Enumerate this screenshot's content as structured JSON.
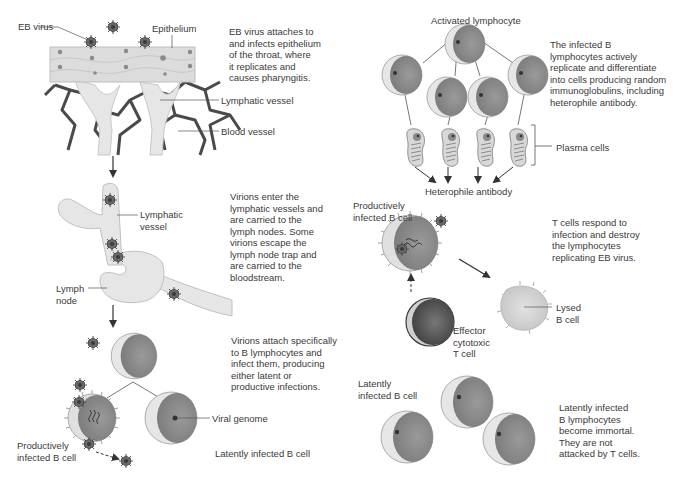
{
  "colors": {
    "background": "#ffffff",
    "text": "#3a3a3a",
    "epithelium": "#d8d8d8",
    "blood_vessel": "#4a4a4a",
    "lymphatic": "#e6e6e6",
    "cell_light": "#e8e8e8",
    "cell_dark": "#8f8f8f",
    "t_cell": "#555555",
    "virus": "#555555"
  },
  "left_panel": {
    "step1": {
      "labels": {
        "eb_virus": "EB virus",
        "epithelium": "Epithelium",
        "lymphatic_vessel": "Lymphatic vessel",
        "blood_vessel": "Blood vessel"
      },
      "description": "EB virus attaches to\nand infects epithelium\nof the throat, where\nit replicates and\ncauses pharyngitis."
    },
    "step2": {
      "labels": {
        "lymphatic_vessel": "Lymphatic\nvessel",
        "lymph_node": "Lymph\nnode"
      },
      "description": "Virions enter the\nlymphatic vessels and\nare carried to the\nlymph nodes. Some\nvirions escape the\nlymph node trap and\nare carried to the\nbloodstream."
    },
    "step3": {
      "labels": {
        "viral_genome": "Viral genome",
        "productively_infected": "Productively\ninfected B cell",
        "latently_infected": "Latently infected B cell"
      },
      "description": "Virions attach specifically\nto B lymphocytes and\ninfect them, producing\neither latent or\nproductive infections."
    }
  },
  "right_panel": {
    "step4": {
      "labels": {
        "activated_lymphocyte": "Activated lymphocyte",
        "plasma_cells": "Plasma cells",
        "heterophile_antibody": "Heterophile antibody"
      },
      "description": "The infected B\nlymphocytes actively\nreplicate and differentiate\ninto cells producing random\nimmunoglobulins, including\nheterophile antibody."
    },
    "step5": {
      "labels": {
        "productively_infected": "Productively\ninfected B cell",
        "lysed_b_cell": "Lysed\nB cell",
        "effector_t_cell": "Effector\ncytotoxic\nT cell"
      },
      "description": "T cells respond to\ninfection and destroy\nthe lymphocytes\nreplicating EB virus."
    },
    "step6": {
      "labels": {
        "latently_infected": "Latently\ninfected B cell"
      },
      "description": "Latently infected\nB lymphocytes\nbecome immortal.\nThey are not\nattacked by T cells."
    }
  }
}
